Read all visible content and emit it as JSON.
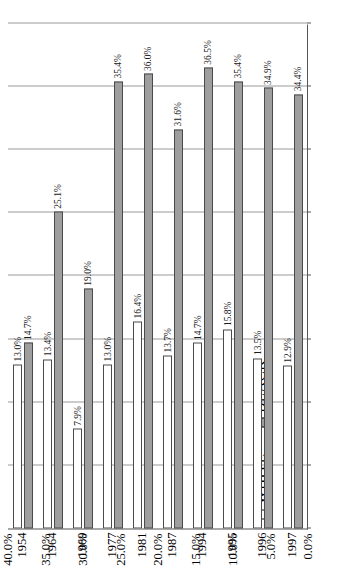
{
  "chart_data": {
    "type": "bar",
    "orientation": "vertical-rendered-rotated",
    "title": "",
    "xlabel": "",
    "ylabel": "",
    "ylim": [
      0,
      40
    ],
    "ytick_labels": [
      "0.0%",
      "5.0%",
      "10.0%",
      "15.0%",
      "20.0%",
      "25.0%",
      "30.0%",
      "35.0%",
      "40.0%"
    ],
    "ytick_values": [
      0,
      5,
      10,
      15,
      20,
      25,
      30,
      35,
      40
    ],
    "grid": true,
    "legend_position": "left",
    "categories": [
      "1954",
      "1964",
      "1969",
      "1977",
      "1981",
      "1987",
      "1994",
      "1995",
      "1996",
      "1997"
    ],
    "series": [
      {
        "name": "WHITE",
        "color": "#ffffff",
        "values": [
          13.0,
          13.4,
          7.9,
          13.0,
          16.4,
          13.7,
          14.7,
          15.8,
          13.5,
          12.9
        ],
        "labels": [
          "13.0%",
          "13.4%",
          "7.9%",
          "13.0%",
          "16.4%",
          "13.7%",
          "14.7%",
          "15.8%",
          "13.5%",
          "12.9%"
        ]
      },
      {
        "name": "BLACK",
        "color": "#9e9e9e",
        "values": [
          14.7,
          25.1,
          19.0,
          35.4,
          36.0,
          31.6,
          36.5,
          35.4,
          34.9,
          34.4
        ],
        "labels": [
          "14.7%",
          "25.1%",
          "19.0%",
          "35.4%",
          "36.0%",
          "31.6%",
          "36.5%",
          "35.4%",
          "34.9%",
          "34.4%"
        ]
      }
    ]
  },
  "legend": {
    "items": [
      {
        "label": "WHITE",
        "swatch": "open-square"
      },
      {
        "label": "BLACK",
        "swatch": "filled-square"
      }
    ]
  },
  "colors": {
    "black_series": "#9e9e9e",
    "white_series": "#ffffff",
    "axis": "#555555",
    "grid": "#9a9a9a",
    "text": "#1a1a1a"
  }
}
